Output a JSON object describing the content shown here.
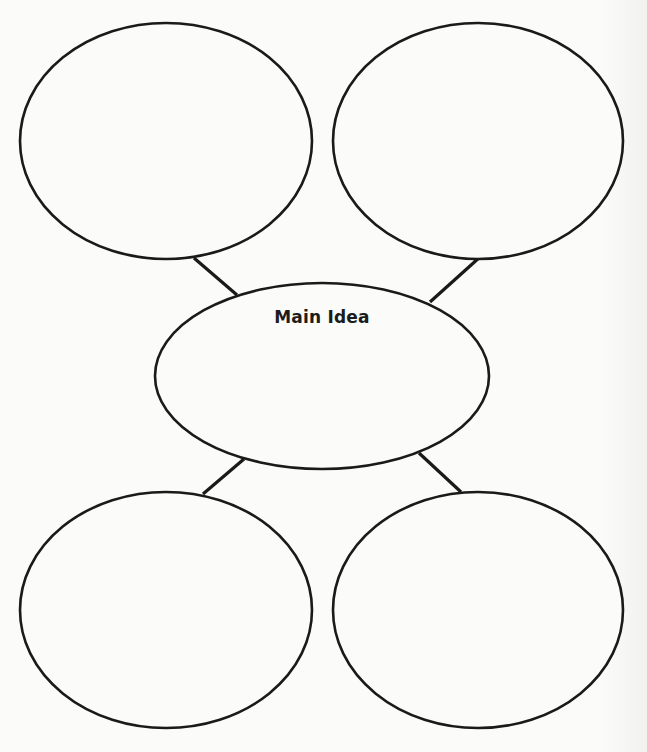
{
  "diagram": {
    "type": "main-idea-web",
    "stroke_color": "#1a1a1a",
    "background_color": "#fbfbf9",
    "center": {
      "label": "Main Idea",
      "cx": 322,
      "cy": 376,
      "rx": 167,
      "ry": 93
    },
    "details": [
      {
        "id": "top-left",
        "label": "",
        "cx": 166,
        "cy": 141,
        "rx": 146,
        "ry": 118
      },
      {
        "id": "top-right",
        "label": "",
        "cx": 478,
        "cy": 141,
        "rx": 145,
        "ry": 118
      },
      {
        "id": "bottom-left",
        "label": "",
        "cx": 166,
        "cy": 610,
        "rx": 146,
        "ry": 118
      },
      {
        "id": "bottom-right",
        "label": "",
        "cx": 478,
        "cy": 610,
        "rx": 145,
        "ry": 118
      }
    ],
    "connectors": [
      {
        "from": "top-left",
        "x1": 194,
        "y1": 258,
        "x2": 237,
        "y2": 295
      },
      {
        "from": "top-right",
        "x1": 480,
        "y1": 257,
        "x2": 430,
        "y2": 302
      },
      {
        "from": "bottom-left",
        "x1": 244,
        "y1": 459,
        "x2": 203,
        "y2": 494
      },
      {
        "from": "bottom-right",
        "x1": 419,
        "y1": 453,
        "x2": 461,
        "y2": 492
      }
    ]
  }
}
